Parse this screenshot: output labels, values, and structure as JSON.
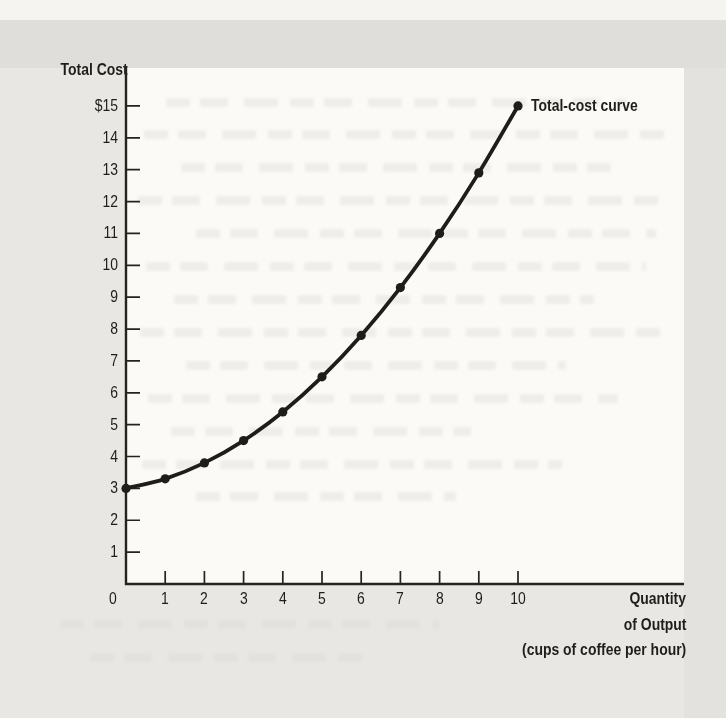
{
  "figure": {
    "y_axis_title": "Total Cost",
    "curve_label": "Total-cost curve",
    "x_axis_title_lines": [
      "Quantity",
      "of Output",
      "(cups of coffee per hour)"
    ],
    "colors": {
      "ink": "#242320",
      "curve": "#1e1d1b",
      "paper": "#e8e7e3",
      "scan_band": "#dfdeda",
      "top_strip": "#f5f4f0",
      "plot_background": "#fbfaf6"
    }
  },
  "chart_data": {
    "type": "line",
    "title": "",
    "xlabel": "Quantity of Output (cups of coffee per hour)",
    "ylabel": "Total Cost",
    "x": [
      0,
      1,
      2,
      3,
      4,
      5,
      6,
      7,
      8,
      9,
      10
    ],
    "series": [
      {
        "name": "Total-cost curve",
        "values": [
          3.0,
          3.3,
          3.8,
          4.5,
          5.4,
          6.5,
          7.8,
          9.3,
          11.0,
          12.9,
          15.0
        ]
      }
    ],
    "x_tick_labels": [
      "0",
      "1",
      "2",
      "3",
      "4",
      "5",
      "6",
      "7",
      "8",
      "9",
      "10"
    ],
    "y_tick_values": [
      1,
      2,
      3,
      4,
      5,
      6,
      7,
      8,
      9,
      10,
      11,
      12,
      13,
      14,
      15
    ],
    "y_tick_labels": [
      "1",
      "2",
      "3",
      "4",
      "5",
      "6",
      "7",
      "8",
      "9",
      "10",
      "11",
      "12",
      "13",
      "14",
      "$15"
    ],
    "xlim": [
      0,
      10
    ],
    "ylim": [
      0,
      15
    ],
    "grid": false,
    "legend_position": "none",
    "annotation": "Total-cost curve labels the final data point at quantity 10, cost $15",
    "marker": "filled-dot"
  }
}
